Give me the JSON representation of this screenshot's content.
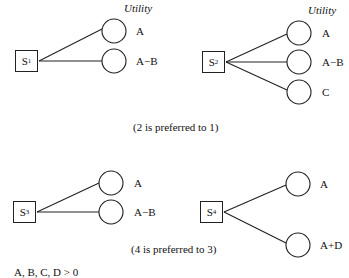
{
  "diagrams": [
    {
      "id": "S1",
      "label": "S",
      "sub": "1",
      "utility_header": "Utility",
      "outcomes": [
        "A",
        "A−B"
      ]
    },
    {
      "id": "S2",
      "label": "S",
      "sub": "2",
      "utility_header": "Utility",
      "outcomes": [
        "A",
        "A−B",
        "C"
      ]
    },
    {
      "id": "S3",
      "label": "S",
      "sub": "3",
      "outcomes": [
        "A",
        "A−B"
      ]
    },
    {
      "id": "S4",
      "label": "S",
      "sub": "4",
      "outcomes": [
        "A",
        "A+D"
      ]
    }
  ],
  "captions": {
    "top": "(2 is preferred to 1)",
    "bottom": "(4 is preferred to 3)",
    "footnote": "A, B, C, D > 0"
  }
}
